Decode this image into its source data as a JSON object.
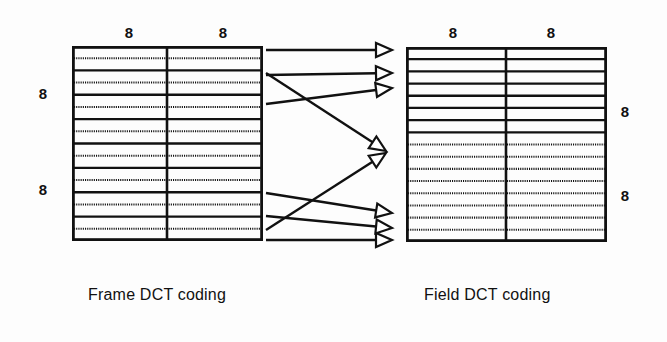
{
  "figure": {
    "background_color": "#fdfdfd",
    "ink_color": "#111111"
  },
  "left_block": {
    "name": "frame-dct-block",
    "caption": "Frame DCT coding",
    "caption_x": 88,
    "caption_y": 286,
    "x": 72,
    "y": 46,
    "width": 191,
    "height": 195,
    "rows": 16,
    "columns": 2,
    "divider_x": 167,
    "row_pattern": "alternating-fields-interleaved",
    "row_styles": [
      "solid",
      "dotted",
      "solid",
      "dotted",
      "solid",
      "dotted",
      "solid",
      "dotted",
      "solid",
      "dotted",
      "solid",
      "dotted",
      "solid",
      "dotted",
      "solid",
      "dotted"
    ],
    "top_labels": [
      {
        "text": "8",
        "x": 118,
        "y": 25
      },
      {
        "text": "8",
        "x": 212,
        "y": 25
      }
    ],
    "side_labels": [
      {
        "text": "8",
        "x": 32,
        "y": 86
      },
      {
        "text": "8",
        "x": 32,
        "y": 182
      }
    ]
  },
  "right_block": {
    "name": "field-dct-block",
    "caption": "Field DCT coding",
    "caption_x": 424,
    "caption_y": 286,
    "x": 406,
    "y": 47,
    "width": 201,
    "height": 195,
    "rows": 16,
    "columns": 2,
    "divider_x": 506,
    "row_pattern": "fields-separated",
    "row_styles": [
      "solid",
      "solid",
      "solid",
      "solid",
      "solid",
      "solid",
      "solid",
      "solid",
      "dotted",
      "dotted",
      "dotted",
      "dotted",
      "dotted",
      "dotted",
      "dotted",
      "dotted"
    ],
    "top_labels": [
      {
        "text": "8",
        "x": 442,
        "y": 25
      },
      {
        "text": "8",
        "x": 540,
        "y": 25
      }
    ],
    "side_labels": [
      {
        "text": "8",
        "x": 614,
        "y": 104
      },
      {
        "text": "8",
        "x": 614,
        "y": 188
      }
    ]
  },
  "mapping_arrows": {
    "name": "field-reordering-arrows",
    "count": 8,
    "description": "Arrows mapping interleaved frame lines to separated field lines",
    "arrows": [
      {
        "id": "a1",
        "x1": 266,
        "y1": 50,
        "x2": 392,
        "y2": 50,
        "head": "open-triangle"
      },
      {
        "id": "a2",
        "x1": 266,
        "y1": 75,
        "x2": 392,
        "y2": 73,
        "head": "open-triangle"
      },
      {
        "id": "a3",
        "x1": 266,
        "y1": 104,
        "x2": 392,
        "y2": 88,
        "head": "open-triangle"
      },
      {
        "id": "a4",
        "x1": 266,
        "y1": 73,
        "x2": 386,
        "y2": 151,
        "head": "open-triangle"
      },
      {
        "id": "a5",
        "x1": 266,
        "y1": 230,
        "x2": 386,
        "y2": 153,
        "head": "open-triangle"
      },
      {
        "id": "a6",
        "x1": 266,
        "y1": 193,
        "x2": 392,
        "y2": 213,
        "head": "open-triangle"
      },
      {
        "id": "a7",
        "x1": 266,
        "y1": 216,
        "x2": 392,
        "y2": 228,
        "head": "open-triangle"
      },
      {
        "id": "a8",
        "x1": 266,
        "y1": 240,
        "x2": 392,
        "y2": 240,
        "head": "open-triangle"
      }
    ]
  }
}
